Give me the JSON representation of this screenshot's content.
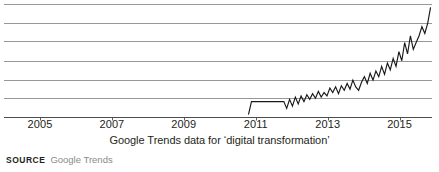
{
  "chart_data": {
    "type": "line",
    "title": "",
    "subtitle": "",
    "xlabel": "Google Trends data for ‘digital transformation’",
    "ylabel": "",
    "xlim": [
      2004.0,
      2015.9
    ],
    "ylim": [
      0,
      100
    ],
    "grid": true,
    "grid_lines_y": [
      17,
      33,
      50,
      67,
      83,
      100
    ],
    "legend": "none",
    "tick_labels_x": [
      "2005",
      "2007",
      "2009",
      "2011",
      "2013",
      "2015"
    ],
    "tick_values_x": [
      2005,
      2007,
      2009,
      2011,
      2013,
      2015
    ],
    "series": [
      {
        "name": "digital transformation",
        "x": [
          2010.79,
          2010.8,
          2010.88,
          2011.0,
          2011.2,
          2011.4,
          2011.6,
          2011.78,
          2011.86,
          2011.94,
          2012.02,
          2012.1,
          2012.18,
          2012.26,
          2012.34,
          2012.42,
          2012.5,
          2012.58,
          2012.66,
          2012.74,
          2012.82,
          2012.9,
          2012.98,
          2013.06,
          2013.14,
          2013.22,
          2013.3,
          2013.38,
          2013.46,
          2013.54,
          2013.62,
          2013.7,
          2013.78,
          2013.86,
          2013.94,
          2014.02,
          2014.1,
          2014.18,
          2014.26,
          2014.34,
          2014.42,
          2014.5,
          2014.58,
          2014.66,
          2014.74,
          2014.82,
          2014.9,
          2014.98,
          2015.06,
          2015.14,
          2015.22,
          2015.3,
          2015.38,
          2015.46,
          2015.54,
          2015.62,
          2015.7,
          2015.78,
          2015.86
        ],
        "y": [
          3,
          3,
          14,
          14,
          14,
          14,
          14,
          14,
          8,
          16,
          10,
          18,
          12,
          19,
          14,
          20,
          16,
          21,
          17,
          23,
          18,
          22,
          19,
          26,
          22,
          27,
          21,
          28,
          24,
          30,
          25,
          33,
          27,
          24,
          31,
          36,
          30,
          39,
          33,
          41,
          36,
          45,
          38,
          48,
          42,
          52,
          45,
          58,
          50,
          66,
          56,
          72,
          60,
          66,
          72,
          80,
          74,
          83,
          97
        ]
      }
    ]
  },
  "figure": {
    "caption": "Google Trends data for ‘digital transformation’",
    "source_label": "SOURCE",
    "source_value": "Google Trends"
  },
  "colors": {
    "line": "#1a1a1a",
    "grid": "#8c8c8c",
    "axis": "#4d4d4d",
    "text": "#231f20",
    "muted_text": "#8a8a8a",
    "background": "#ffffff"
  }
}
